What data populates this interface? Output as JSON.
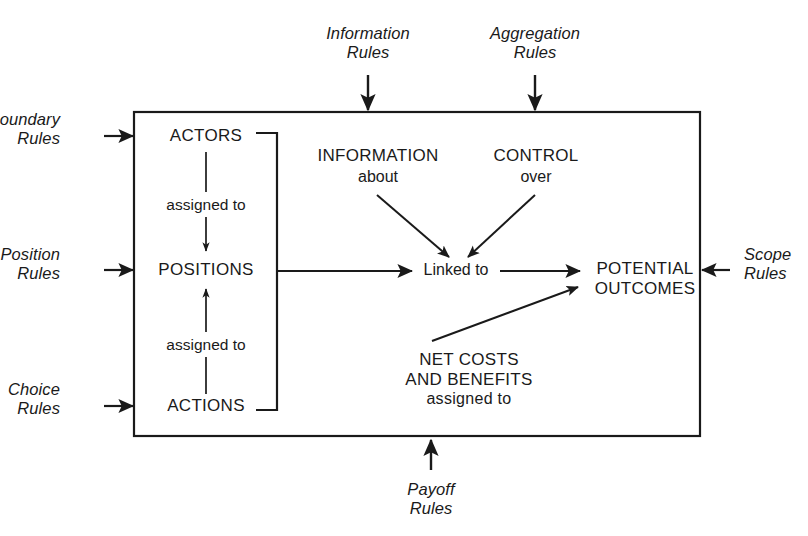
{
  "diagram": {
    "type": "framework-diagram",
    "background_color": "#ffffff",
    "line_color": "#1a1a1a",
    "arena_box": {
      "name": "action-arena-box",
      "x": 134,
      "y": 112,
      "width": 566,
      "height": 324
    },
    "external_rules": [
      {
        "id": "boundary",
        "label_line1": "Boundary",
        "label_line2": "Rules",
        "side": "left",
        "arrow": "right"
      },
      {
        "id": "position",
        "label_line1": "Position",
        "label_line2": "Rules",
        "side": "left",
        "arrow": "right"
      },
      {
        "id": "choice",
        "label_line1": "Choice",
        "label_line2": "Rules",
        "side": "left",
        "arrow": "right"
      },
      {
        "id": "information",
        "label_line1": "Information",
        "label_line2": "Rules",
        "side": "top",
        "arrow": "down"
      },
      {
        "id": "aggregation",
        "label_line1": "Aggregation",
        "label_line2": "Rules",
        "side": "top",
        "arrow": "down"
      },
      {
        "id": "scope",
        "label_line1": "Scope",
        "label_line2": "Rules",
        "side": "right",
        "arrow": "left"
      },
      {
        "id": "payoff",
        "label_line1": "Payoff",
        "label_line2": "Rules",
        "side": "bottom",
        "arrow": "up"
      }
    ],
    "nodes": {
      "actors": "ACTORS",
      "positions": "POSITIONS",
      "actions": "ACTIONS",
      "information": "INFORMATION",
      "information_sub": "about",
      "control": "CONTROL",
      "control_sub": "over",
      "linked_to": "Linked to",
      "potential_outcomes_line1": "POTENTIAL",
      "potential_outcomes_line2": "OUTCOMES",
      "net_costs_line1": "NET COSTS",
      "net_costs_line2": "AND BENEFITS",
      "net_costs_sub": "assigned to"
    },
    "edge_labels": {
      "actors_to_positions": "assigned to",
      "actions_to_positions": "assigned to"
    }
  }
}
